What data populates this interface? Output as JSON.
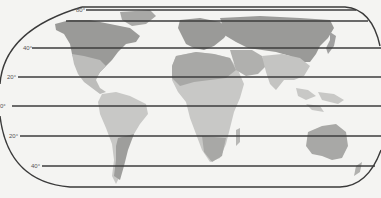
{
  "map": {
    "type": "world-map",
    "projection": "rounded-rectangle",
    "colors": {
      "background": "#f4f4f2",
      "border": "#3a3a3a",
      "latitude_line": "#3c3c3c",
      "land_light": "#c8c8c6",
      "land_medium": "#a8a8a6",
      "land_dark": "#8a8a88",
      "label": "#555555"
    },
    "latitude_lines": [
      {
        "label": "80°",
        "y": 10,
        "x1": 82,
        "x2": 358
      },
      {
        "label": "",
        "y": 21,
        "x1": 68,
        "x2": 368
      },
      {
        "label": "40°",
        "y": 48,
        "x1": 32,
        "x2": 381
      },
      {
        "label": "20°",
        "y": 77,
        "x1": 18,
        "x2": 381
      },
      {
        "label": "0°",
        "y": 106,
        "x1": 12,
        "x2": 381
      },
      {
        "label": "20°",
        "y": 136,
        "x1": 20,
        "x2": 381
      },
      {
        "label": "40°",
        "y": 166,
        "x1": 42,
        "x2": 375
      }
    ],
    "labels_positions": [
      {
        "text_index": 0,
        "x": 76,
        "y": 7
      },
      {
        "text_index": 2,
        "x": 23,
        "y": 45
      },
      {
        "text_index": 3,
        "x": 6,
        "y": 74
      },
      {
        "text_index": 4,
        "x": 0,
        "y": 103
      },
      {
        "text_index": 5,
        "x": 9,
        "y": 133
      },
      {
        "text_index": 6,
        "x": 31,
        "y": 163
      }
    ]
  }
}
